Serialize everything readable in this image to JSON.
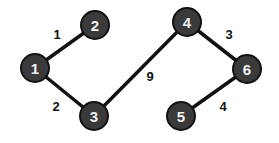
{
  "graph": {
    "nodes": [
      {
        "id": "1",
        "label": "1",
        "x": 35,
        "y": 68
      },
      {
        "id": "2",
        "label": "2",
        "x": 95,
        "y": 25
      },
      {
        "id": "3",
        "label": "3",
        "x": 94,
        "y": 116
      },
      {
        "id": "4",
        "label": "4",
        "x": 187,
        "y": 22
      },
      {
        "id": "5",
        "label": "5",
        "x": 181,
        "y": 116
      },
      {
        "id": "6",
        "label": "6",
        "x": 247,
        "y": 69
      }
    ],
    "edges": [
      {
        "from": "1",
        "to": "2",
        "weight": "1",
        "lx": 57,
        "ly": 39
      },
      {
        "from": "1",
        "to": "3",
        "weight": "2",
        "lx": 56,
        "ly": 111
      },
      {
        "from": "3",
        "to": "4",
        "weight": "9",
        "lx": 150,
        "ly": 81
      },
      {
        "from": "4",
        "to": "6",
        "weight": "3",
        "lx": 229,
        "ly": 39
      },
      {
        "from": "6",
        "to": "5",
        "weight": "4",
        "lx": 223,
        "ly": 111
      }
    ]
  }
}
